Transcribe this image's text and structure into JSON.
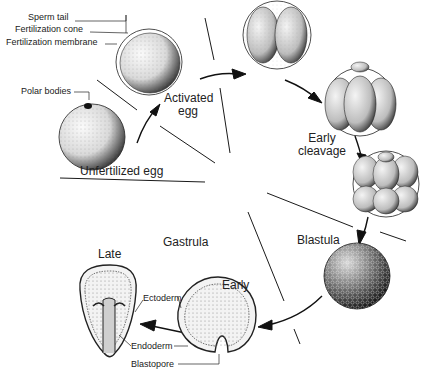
{
  "diagram": {
    "stages": [
      {
        "id": "unfertilized",
        "label": "Unfertilized egg"
      },
      {
        "id": "activated",
        "label_line1": "Activated",
        "label_line2": "egg"
      },
      {
        "id": "early-cleavage",
        "label_line1": "Early",
        "label_line2": "cleavage"
      },
      {
        "id": "blastula",
        "label": "Blastula"
      },
      {
        "id": "gastrula",
        "label": "Gastrula",
        "early_label": "Early",
        "late_label": "Late"
      }
    ],
    "callouts": {
      "sperm_tail": "Sperm tail",
      "fertilization_cone": "Fertilization cone",
      "fertilization_membrane": "Fertilization membrane",
      "polar_bodies": "Polar bodies",
      "ectoderm": "Ectoderm",
      "endoderm": "Endoderm",
      "blastopore": "Blastopore"
    },
    "colors": {
      "ink": "#1a1a1a",
      "background": "#ffffff",
      "shade_light": "#f2f2f2",
      "shade_dark": "#555555"
    }
  }
}
